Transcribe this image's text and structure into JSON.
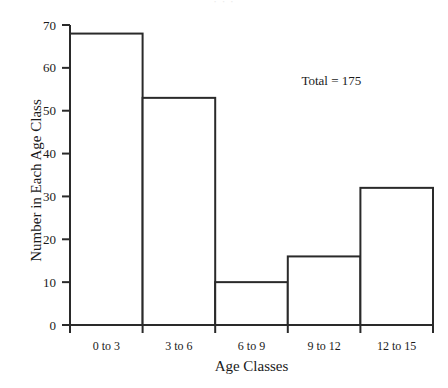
{
  "chart_data": {
    "type": "bar",
    "title": "",
    "xlabel": "Age Classes",
    "ylabel": "Number in Each Age Class",
    "categories": [
      "0 to 3",
      "3 to 6",
      "6 to 9",
      "9 to 12",
      "12 to 15"
    ],
    "values": [
      68,
      53,
      10,
      16,
      32
    ],
    "ylim": [
      0,
      70
    ],
    "yticks": [
      0,
      10,
      20,
      30,
      40,
      50,
      60,
      70
    ],
    "ytick_labels": [
      "0",
      "10",
      "20",
      "30",
      "40",
      "50",
      "60",
      "70"
    ],
    "grid": false,
    "legend": "none",
    "annotations": [
      {
        "text": "Total = 175",
        "x_frac": 0.72,
        "y_value": 56
      }
    ],
    "bar_style": {
      "fill": "#ffffff",
      "edge_color": "#2a2a2a",
      "edge_width": 2,
      "gap": 0
    },
    "axis_color": "#2a2a2a"
  },
  "header": {
    "faint_title": "· · ·"
  }
}
